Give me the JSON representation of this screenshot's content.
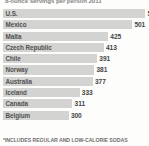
{
  "chart_data": {
    "type": "bar",
    "orientation": "horizontal",
    "title": "8-ounce servings per person 2011",
    "subtitle": "",
    "xlabel": "",
    "ylabel": "",
    "categories": [
      "U.S.",
      "Mexico",
      "Malta",
      "Czech Republic",
      "Chile",
      "Norway",
      "Australia",
      "Iceland",
      "Canada",
      "Belgium"
    ],
    "values": [
      520,
      501,
      425,
      413,
      391,
      381,
      377,
      333,
      311,
      300
    ],
    "value_labels": [
      "52",
      "501",
      "425",
      "413",
      "391",
      "381",
      "377",
      "333",
      "311",
      "300"
    ],
    "xlim": [
      0,
      560
    ],
    "grid": false,
    "legend": null,
    "annotations": [
      "*INCLUDES REGULAR AND LOW-CALORIE SODAS"
    ],
    "colors": {
      "bar": "#c9c9c7",
      "text": "#3d3d3d",
      "background": "#fdfdfc"
    }
  },
  "footnote": "*INCLUDES REGULAR AND LOW-CALORIE SODAS",
  "rows": [
    {
      "label": "U.S.",
      "value": "52",
      "bar_pct": 97.5,
      "value_left_pct": 99.0
    },
    {
      "label": "Mexico",
      "value": "501",
      "bar_pct": 88.5,
      "value_left_pct": 90.0
    },
    {
      "label": "Malta",
      "value": "425",
      "bar_pct": 72.0,
      "value_left_pct": 73.5
    },
    {
      "label": "Czech Republic",
      "value": "413",
      "bar_pct": 69.0,
      "value_left_pct": 70.5
    },
    {
      "label": "Chile",
      "value": "391",
      "bar_pct": 64.5,
      "value_left_pct": 66.0
    },
    {
      "label": "Norway",
      "value": "381",
      "bar_pct": 62.5,
      "value_left_pct": 64.0
    },
    {
      "label": "Australia",
      "value": "377",
      "bar_pct": 61.5,
      "value_left_pct": 63.0
    },
    {
      "label": "Iceland",
      "value": "333",
      "bar_pct": 52.5,
      "value_left_pct": 54.0
    },
    {
      "label": "Canada",
      "value": "311",
      "bar_pct": 47.5,
      "value_left_pct": 49.0
    },
    {
      "label": "Belgium",
      "value": "300",
      "bar_pct": 45.0,
      "value_left_pct": 46.5
    }
  ]
}
